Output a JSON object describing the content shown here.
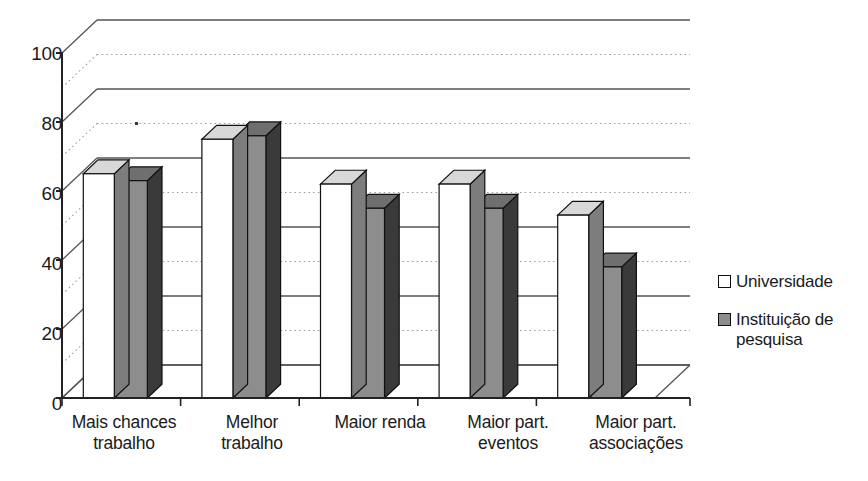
{
  "chart_data": {
    "type": "bar",
    "title": "",
    "subtitle": "",
    "xlabel": "",
    "ylabel": "",
    "ylim": [
      0,
      100
    ],
    "yticks": [
      0,
      20,
      40,
      60,
      80,
      100
    ],
    "grid": true,
    "grid_minor_dotted": true,
    "legend_position": "right",
    "style": "3d-clustered-column",
    "categories": [
      "Mais chances trabalho",
      "Melhor trabalho",
      "Maior renda",
      "Maior part. eventos",
      "Maior part. associações"
    ],
    "categories_lines": [
      [
        "Mais chances",
        "trabalho"
      ],
      [
        "Melhor",
        "trabalho"
      ],
      [
        "Maior renda",
        ""
      ],
      [
        "Maior part.",
        "eventos"
      ],
      [
        "Maior part.",
        "associações"
      ]
    ],
    "series": [
      {
        "name": "Universidade",
        "color": "#ffffff",
        "values": [
          65,
          75,
          62,
          62,
          53
        ]
      },
      {
        "name": "Instituição de pesquisa",
        "color": "#8d8d8d",
        "values": [
          63,
          76,
          55,
          55,
          38
        ]
      }
    ]
  },
  "legend": {
    "items": [
      {
        "label": "Universidade",
        "swatch": "white"
      },
      {
        "label": "Instituição de pesquisa",
        "label_line1": "Instituição de",
        "label_line2": "pesquisa",
        "swatch": "gray"
      }
    ]
  },
  "colors": {
    "series_university_face": "#ffffff",
    "series_institute_face": "#8d8d8d",
    "series_institute_side": "#3a3a3a",
    "series_top_light": "#d8d8d8",
    "axis": "#222222",
    "gridline": "#555555",
    "gridline_dotted": "#9a9a9a",
    "text": "#1b1b1b"
  },
  "axis": {
    "y_tick_labels": [
      "100",
      "80",
      "60",
      "40",
      "20",
      "0"
    ]
  }
}
